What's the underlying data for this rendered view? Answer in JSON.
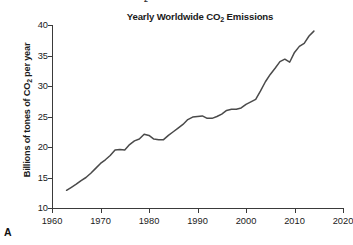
{
  "figure": {
    "panel_letter": "A",
    "caption_fragment": "Emissions in metric tons of CO2"
  },
  "chart_data": {
    "type": "line",
    "title": "Yearly Worldwide CO2 Emissions",
    "xlabel": "",
    "ylabel": "Billions of tones of CO2 per year",
    "xlim": [
      1960,
      2020
    ],
    "ylim": [
      10,
      40
    ],
    "grid": false,
    "legend": null,
    "xticks": [
      "1960",
      "1970",
      "1980",
      "1990",
      "2000",
      "2010",
      "2020"
    ],
    "yticks": [
      "10",
      "15",
      "20",
      "25",
      "30",
      "35",
      "40"
    ],
    "series": [
      {
        "name": "Global CO2 emissions",
        "color": "#4a4a4a",
        "x": [
          1963,
          1964,
          1965,
          1966,
          1967,
          1968,
          1969,
          1970,
          1971,
          1972,
          1973,
          1974,
          1975,
          1976,
          1977,
          1978,
          1979,
          1980,
          1981,
          1982,
          1983,
          1984,
          1985,
          1986,
          1987,
          1988,
          1989,
          1990,
          1991,
          1992,
          1993,
          1994,
          1995,
          1996,
          1997,
          1998,
          1999,
          2000,
          2001,
          2002,
          2003,
          2004,
          2005,
          2006,
          2007,
          2008,
          2009,
          2010,
          2011,
          2012,
          2013,
          2014
        ],
        "values": [
          12.9,
          13.4,
          13.9,
          14.5,
          15.0,
          15.7,
          16.5,
          17.3,
          17.9,
          18.6,
          19.5,
          19.6,
          19.5,
          20.4,
          21.0,
          21.3,
          22.1,
          21.9,
          21.3,
          21.2,
          21.2,
          21.9,
          22.5,
          23.1,
          23.7,
          24.5,
          24.9,
          25.0,
          25.1,
          24.7,
          24.7,
          25.0,
          25.4,
          26.0,
          26.2,
          26.2,
          26.4,
          27.0,
          27.4,
          27.8,
          29.2,
          30.7,
          31.9,
          32.9,
          34.0,
          34.4,
          33.9,
          35.5,
          36.5,
          37.0,
          38.2,
          39.0
        ]
      }
    ]
  }
}
